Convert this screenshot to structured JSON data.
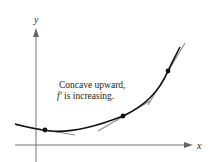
{
  "diagram": {
    "axes": {
      "x_label": "x",
      "y_label": "y"
    },
    "annotation": {
      "line1": "Concave upward,",
      "line2_func": "f′",
      "line2_rest": " is increasing."
    },
    "curve_description": "Concave upward curve with three points and their tangent lines",
    "points": [
      {
        "name": "point-1",
        "x": 45,
        "y": 130
      },
      {
        "name": "point-2",
        "x": 123,
        "y": 116
      },
      {
        "name": "point-3",
        "x": 168,
        "y": 71
      }
    ],
    "colors": {
      "curve": "#111111",
      "tangent": "#8a8a8a",
      "axis": "#777777"
    }
  }
}
